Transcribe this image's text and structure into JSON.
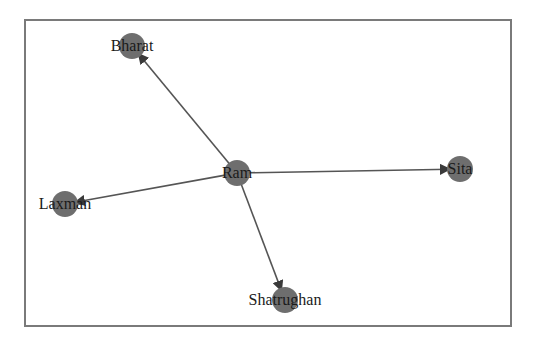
{
  "graph": {
    "type": "directed",
    "node_color": "#6e6e6e",
    "edge_color": "#555555",
    "nodes": [
      {
        "id": "Ram",
        "label": "Ram",
        "x": 237,
        "y": 173
      },
      {
        "id": "Bharat",
        "label": "Bharat",
        "x": 132,
        "y": 46
      },
      {
        "id": "Sita",
        "label": "Sita",
        "x": 460,
        "y": 169
      },
      {
        "id": "Laxman",
        "label": "Laxman",
        "x": 65,
        "y": 204
      },
      {
        "id": "Shatrughan",
        "label": "Shatrughan",
        "x": 285,
        "y": 300
      }
    ],
    "edges": [
      {
        "from": "Ram",
        "to": "Bharat"
      },
      {
        "from": "Ram",
        "to": "Sita"
      },
      {
        "from": "Ram",
        "to": "Laxman"
      },
      {
        "from": "Ram",
        "to": "Shatrughan"
      }
    ]
  }
}
